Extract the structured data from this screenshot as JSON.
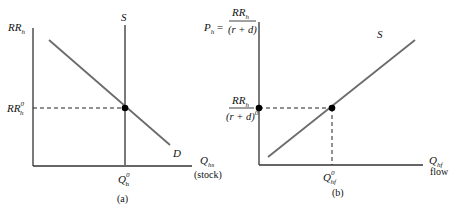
{
  "figure": {
    "panel_a": {
      "caption": "(a)",
      "y_axis_label": "RR",
      "y_axis_sub": "h",
      "x_axis_label": "Q",
      "x_axis_sub": "hs",
      "x_axis_note": "(stock)",
      "supply_label": "S",
      "demand_label": "D",
      "eq_y_label": "RR",
      "eq_y_sub": "h",
      "eq_y_sup": "0",
      "eq_x_label": "Q",
      "eq_x_sub": "h",
      "eq_x_sup": "0"
    },
    "panel_b": {
      "caption": "(b)",
      "y_axis_prefix": "P",
      "y_axis_prefix_sub": "h",
      "y_axis_eq": " =",
      "y_axis_num": "RR",
      "y_axis_num_sub": "h",
      "y_axis_den": "(r + d)",
      "x_axis_label": "Q",
      "x_axis_sub": "hf",
      "x_axis_note": "flow",
      "supply_label": "S",
      "eq_y_num": "RR",
      "eq_y_num_sub": "h",
      "eq_y_den": "(r + d)",
      "eq_y_den_sup": "0",
      "eq_x_label": "Q",
      "eq_x_sub": "hf",
      "eq_x_sup": "0"
    },
    "colors": {
      "curve": "#6b6b6b",
      "axis": "#333333",
      "point": "#000000",
      "dashed": "#222222"
    }
  }
}
